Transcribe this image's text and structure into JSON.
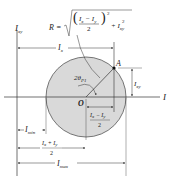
{
  "diagram": {
    "type": "Mohr's circle for moments of inertia",
    "axes": {
      "vertical_label": "I",
      "vertical_sub": "xy",
      "horizontal_label": "I"
    },
    "formula": {
      "lhs": "R =",
      "num": "I",
      "num_sub1": "x",
      "minus": " − ",
      "num2": "I",
      "num_sub2": "y",
      "den": "2",
      "exp": "2",
      "plus": "+ I",
      "plus_sub": "xy",
      "plus_exp": "2"
    },
    "dimensions": {
      "ix": {
        "main": "I",
        "sub": "x"
      },
      "ixy_right": {
        "main": "I",
        "sub": "xy"
      },
      "imin": {
        "main": "I",
        "sub": "min"
      },
      "imax": {
        "main": "I",
        "sub": "max"
      },
      "half_diff": {
        "num": "I",
        "num_sub1": "x",
        "minus": " − ",
        "num2": "I",
        "num_sub2": "y",
        "den": "2"
      },
      "half_sum": {
        "num": "I",
        "num_sub1": "x",
        "plus": " + ",
        "num2": "I",
        "num_sub2": "y",
        "den": "2"
      }
    },
    "points": {
      "center": "O",
      "a": "A"
    },
    "angle": {
      "main": "2θ",
      "sub": "P1"
    },
    "colors": {
      "circle_fill": "#d9d9d9",
      "circle_stroke": "#555555",
      "line": "#333333",
      "text": "#222222"
    }
  }
}
